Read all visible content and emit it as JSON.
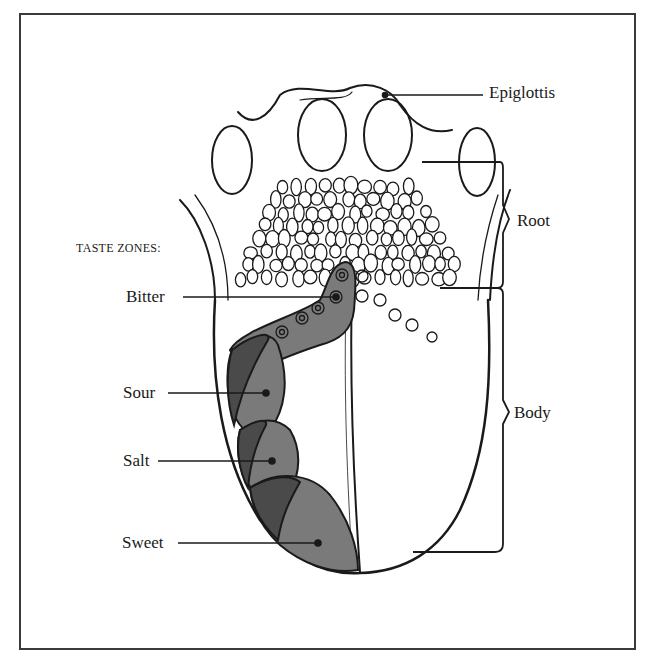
{
  "figure": {
    "heading": "TASTE ZONES:",
    "taste_zones": [
      {
        "name": "Bitter",
        "label": "Bitter"
      },
      {
        "name": "Sour",
        "label": "Sour"
      },
      {
        "name": "Salt",
        "label": "Salt"
      },
      {
        "name": "Sweet",
        "label": "Sweet"
      }
    ],
    "anatomy_labels": {
      "epiglottis": "Epiglottis",
      "root": "Root",
      "body": "Body"
    },
    "colors": {
      "zone_light": "#7a7a7a",
      "zone_dark": "#4a4a4a",
      "ink": "#1a1a1a",
      "background": "#ffffff"
    }
  }
}
